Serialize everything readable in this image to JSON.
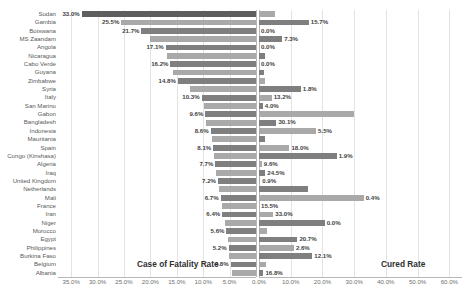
{
  "chart_data": {
    "type": "bar",
    "title": "",
    "subtitle": "",
    "orientation": "horizontal",
    "layout": "bidirectional-tornado",
    "grid": true,
    "legend_position": "none",
    "left_panel": {
      "label": "Case of Fatality Rate",
      "xlabel": "Case of Fatality Rate",
      "axis_ticks": [
        "35.0%",
        "30.0%",
        "25.0%",
        "20.0%",
        "15.0%",
        "10.0%",
        "5.0%",
        "0.0%"
      ],
      "axis_tick_values": [
        35,
        30,
        25,
        20,
        15,
        10,
        5,
        0
      ],
      "xlim": [
        0,
        37.5
      ],
      "direction": "right-to-left",
      "series_name": "Case of Fatality Rate"
    },
    "right_panel": {
      "label": "Cured Rate",
      "xlabel": "Cured Rate",
      "axis_ticks": [
        "0.0%",
        "10.0%",
        "20.0%",
        "30.0%",
        "40.0%",
        "50.0%",
        "60.0%"
      ],
      "axis_tick_values": [
        0,
        10,
        20,
        30,
        40,
        50,
        60
      ],
      "xlim": [
        0,
        64
      ],
      "direction": "left-to-right",
      "series_name": "Cured Rate"
    },
    "categories": [
      "Sudan",
      "Gambia",
      "Botswana",
      "MS Zaandam",
      "Angola",
      "Nicaragua",
      "Cabo Verde",
      "Guyana",
      "Zimbabwe",
      "Syria",
      "Italy",
      "San Marino",
      "Gabon",
      "Bangladesh",
      "Indonesia",
      "Mauritania",
      "Spain",
      "Congo (Kinshasa)",
      "Algeria",
      "Iraq",
      "United Kingdom",
      "Netherlands",
      "Mali",
      "France",
      "Iran",
      "Niger",
      "Morocco",
      "Egypt",
      "Philippines",
      "Burkina Faso",
      "Belgium",
      "Albania"
    ],
    "series": [
      {
        "name": "Case of Fatality Rate",
        "color": "#7f7f7f",
        "values": [
          33.0,
          25.5,
          21.7,
          20.0,
          17.1,
          16.8,
          16.2,
          15.8,
          14.8,
          12.5,
          10.3,
          9.9,
          9.6,
          9.4,
          8.6,
          8.4,
          8.1,
          7.9,
          7.7,
          7.5,
          7.2,
          7.0,
          6.7,
          6.5,
          6.4,
          5.9,
          5.6,
          5.4,
          5.2,
          5.1,
          4.8,
          4.6
        ],
        "labeled_indices": [
          0,
          1,
          2,
          4,
          6,
          8,
          10,
          12,
          14,
          16,
          18,
          20,
          22,
          24,
          26,
          28,
          30
        ],
        "labels": {
          "0": "33.0%",
          "1": "25.5%",
          "2": "21.7%",
          "4": "17.1%",
          "6": "16.2%",
          "8": "14.8%",
          "10": "10.3%",
          "12": "9.6%",
          "14": "8.6%",
          "16": "8.1%",
          "18": "7.7%",
          "20": "7.2%",
          "22": "6.7%",
          "24": "6.4%",
          "26": "5.6%",
          "28": "5.2%",
          "30": "4.8%"
        }
      },
      {
        "name": "Cured Rate",
        "color": "#9c9c9c",
        "values": [
          5.0,
          15.7,
          0.0,
          7.3,
          0.0,
          2.0,
          0.0,
          1.5,
          1.8,
          13.2,
          4.0,
          1.2,
          30.1,
          5.5,
          18.0,
          1.9,
          9.6,
          24.5,
          0.9,
          2.0,
          0.4,
          15.5,
          33.0,
          0.0,
          4.5,
          20.7,
          2.6,
          12.1,
          11.0,
          16.8,
          2.2,
          1.4
        ],
        "labeled_indices": [
          1,
          2,
          3,
          4,
          6,
          9,
          10,
          12,
          13,
          14,
          15,
          16,
          17,
          18,
          20,
          21,
          22,
          23,
          25,
          26,
          27,
          29
        ],
        "labels": {
          "1": "15.7%",
          "2": "0.0%",
          "3": "7.3%",
          "4": "0.0%",
          "6": "0.0%",
          "9": "1.8%",
          "10": "13.2%",
          "11": "4.0%",
          "13": "30.1%",
          "14": "5.5%",
          "16": "18.0%",
          "17": "1.9%",
          "18": "9.6%",
          "19": "24.5%",
          "20": "0.9%",
          "22": "0.4%",
          "23": "15.5%",
          "24": "33.0%",
          "25": "0.0%",
          "27": "20.7%",
          "28": "2.6%",
          "29": "12.1%",
          "31": "16.8%"
        }
      }
    ],
    "colors": {
      "bar_dark": "#5e5e5e",
      "bar_mid": "#7f7f7f",
      "bar_light": "#a9a9a9",
      "gridline": "#e3e3e3",
      "axisline": "#b7b7b7",
      "text": "#595959",
      "label_text": "#3f3f3f",
      "background": "#ffffff"
    }
  }
}
